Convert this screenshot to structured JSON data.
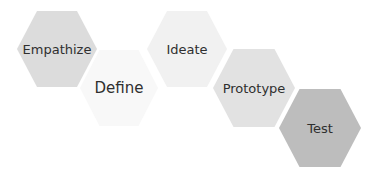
{
  "diagram": {
    "type": "design-thinking-hexagon-process",
    "steps": [
      {
        "label": "Empathize",
        "cx": 57,
        "cy": 49,
        "rx": 40,
        "ry": 38,
        "color": "#dcdcdc",
        "font_size": 13
      },
      {
        "label": "Define",
        "cx": 119,
        "cy": 88,
        "rx": 39,
        "ry": 38,
        "color": "#f8f8f8",
        "font_size": 15
      },
      {
        "label": "Ideate",
        "cx": 187,
        "cy": 49,
        "rx": 40,
        "ry": 38,
        "color": "#f1f1f1",
        "font_size": 13
      },
      {
        "label": "Prototype",
        "cx": 254,
        "cy": 88,
        "rx": 41,
        "ry": 39,
        "color": "#e2e2e2",
        "font_size": 13
      },
      {
        "label": "Test",
        "cx": 320,
        "cy": 128,
        "rx": 41,
        "ry": 39,
        "color": "#bdbdbd",
        "font_size": 13
      }
    ]
  }
}
